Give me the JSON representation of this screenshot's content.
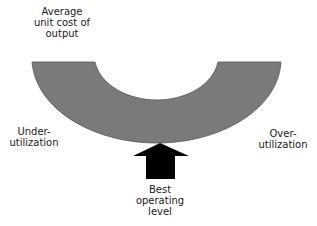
{
  "diagram": {
    "title_lines": [
      "Average",
      "unit cost of",
      "output"
    ],
    "left_label_lines": [
      "Under-",
      "utilization"
    ],
    "right_label_lines": [
      "Over-",
      "utilization"
    ],
    "arrow_label_lines": [
      "Best",
      "operating",
      "level"
    ],
    "colors": {
      "curve_fill": "#7a7a7a",
      "curve_stroke": "#555555",
      "arrow_fill": "#000000",
      "text": "#1a1a1a"
    }
  }
}
